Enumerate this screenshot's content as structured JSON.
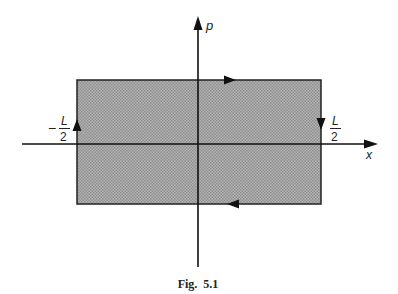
{
  "figure": {
    "caption": "Fig.  5.1",
    "axes": {
      "horizontal_label": "x",
      "vertical_label": "p"
    },
    "labels": {
      "left_bound_sign": "−",
      "left_bound_numerator": "L",
      "left_bound_denominator": "2",
      "right_bound_numerator": "L",
      "right_bound_denominator": "2"
    },
    "region": {
      "description": "shaded rectangle in phase space",
      "fill_color": "#9a9a9a",
      "edge_color": "#222222",
      "arrow_directions": {
        "top": "right",
        "right": "down",
        "bottom": "left",
        "left": "up"
      }
    }
  }
}
